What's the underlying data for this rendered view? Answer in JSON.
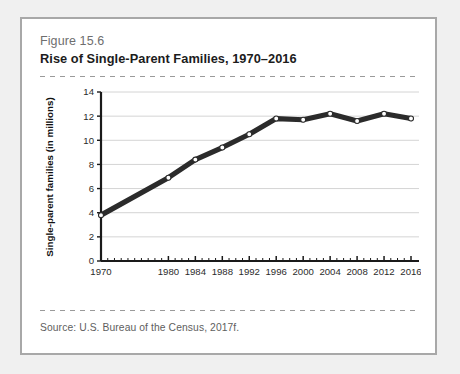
{
  "figure": {
    "number": "Figure 15.6",
    "title": "Rise of Single-Parent Families, 1970–2016",
    "source": "Source:  U.S. Bureau of the Census, 2017f."
  },
  "colors": {
    "card_border": "#a8a8a8",
    "page_background": "#f0f0f0",
    "card_background": "#ffffff",
    "line": "#2b2b2b",
    "marker_fill": "#ffffff",
    "gridline": "#d4d4d4",
    "axis": "#1a1a1a",
    "figure_number_text": "#6e6e6e",
    "title_text": "#1c1c1c",
    "source_text": "#5e5e5e",
    "dashed_rule": "#9a9a9a"
  },
  "chart_data": {
    "type": "line",
    "title": "Rise of Single-Parent Families, 1970–2016",
    "xlabel": "",
    "ylabel": "Single-parent families (in millions)",
    "x": [
      1970,
      1980,
      1984,
      1988,
      1992,
      1996,
      2000,
      2004,
      2008,
      2012,
      2016
    ],
    "values": [
      3.8,
      6.9,
      8.4,
      9.4,
      10.5,
      11.8,
      11.7,
      12.2,
      11.6,
      12.2,
      11.8
    ],
    "xtick_labels": [
      "1970",
      "1980",
      "1984",
      "1988",
      "1992",
      "1996",
      "2000",
      "2004",
      "2008",
      "2012",
      "2016"
    ],
    "ytick_labels": [
      "0",
      "2",
      "4",
      "6",
      "8",
      "10",
      "12",
      "14"
    ],
    "yticks": [
      0,
      2,
      4,
      6,
      8,
      10,
      12,
      14
    ],
    "ylim": [
      0,
      14
    ],
    "xlim": [
      1968,
      2017
    ],
    "grid": "horizontal",
    "legend": "none",
    "markers": "open-circle",
    "minor_xticks": "yearly"
  }
}
